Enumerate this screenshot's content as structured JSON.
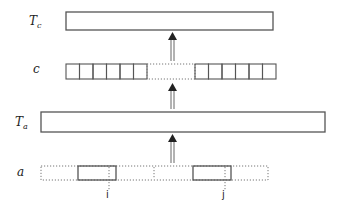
{
  "diagram": {
    "layers": [
      {
        "id": "tc",
        "label_main": "T",
        "label_sub": "c",
        "kind": "solid-bar"
      },
      {
        "id": "c",
        "label_main": "c",
        "label_sub": "",
        "kind": "cell-row",
        "left_cells": 6,
        "right_cells": 6
      },
      {
        "id": "ta",
        "label_main": "T",
        "label_sub": "a",
        "kind": "solid-bar"
      },
      {
        "id": "a",
        "label_main": "a",
        "label_sub": "",
        "kind": "dotted-row-with-spans"
      }
    ],
    "spans": [
      {
        "id": "span-i",
        "index_label": "i"
      },
      {
        "id": "span-j",
        "index_label": "j"
      }
    ],
    "edges": [
      {
        "from": "a",
        "to": "ta"
      },
      {
        "from": "ta",
        "to": "c"
      },
      {
        "from": "c",
        "to": "tc"
      }
    ]
  }
}
